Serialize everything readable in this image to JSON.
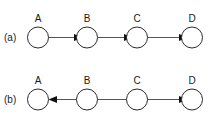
{
  "figure": {
    "background_color": "#ffffff",
    "stroke_color": "#555555",
    "node_stroke_color": "#2b2b2b",
    "node_fill_color": "#ffffff",
    "arrowhead_color": "#111111",
    "label_color": "#1a1a1a",
    "node_radius": 10.5
  },
  "rows": [
    {
      "id": "a",
      "label": "(a)",
      "label_x": 4,
      "label_y": 41,
      "center_y": 37.5,
      "nodes": [
        {
          "name": "A",
          "cx": 38,
          "cy": 37.5,
          "label_x": 38,
          "label_y": 22
        },
        {
          "name": "B",
          "cx": 87,
          "cy": 37.5,
          "label_x": 87,
          "label_y": 22
        },
        {
          "name": "C",
          "cx": 137,
          "cy": 37.5,
          "label_x": 137,
          "label_y": 22
        },
        {
          "name": "D",
          "cx": 192,
          "cy": 37.5,
          "label_x": 192,
          "label_y": 22
        }
      ],
      "edges": [
        {
          "from": "A",
          "to": "B",
          "direction": "right",
          "x1": 48.5,
          "x2": 76.5,
          "y": 37.5
        },
        {
          "from": "B",
          "to": "C",
          "direction": "right",
          "x1": 97.5,
          "x2": 126.5,
          "y": 37.5
        },
        {
          "from": "C",
          "to": "D",
          "direction": "right",
          "x1": 147.5,
          "x2": 181.5,
          "y": 37.5
        }
      ]
    },
    {
      "id": "b",
      "label": "(b)",
      "label_x": 4,
      "label_y": 103,
      "center_y": 99.5,
      "nodes": [
        {
          "name": "A",
          "cx": 38,
          "cy": 99.5,
          "label_x": 38,
          "label_y": 84
        },
        {
          "name": "B",
          "cx": 87,
          "cy": 99.5,
          "label_x": 87,
          "label_y": 84
        },
        {
          "name": "C",
          "cx": 137,
          "cy": 99.5,
          "label_x": 137,
          "label_y": 84
        },
        {
          "name": "D",
          "cx": 192,
          "cy": 99.5,
          "label_x": 192,
          "label_y": 84
        }
      ],
      "edges": [
        {
          "from": "B",
          "to": "A",
          "direction": "left",
          "x1": 87,
          "x2": 48.5,
          "y": 99.5
        },
        {
          "from": "C",
          "to": "D",
          "direction": "right",
          "x1": 137,
          "x2": 181.5,
          "y": 99.5
        }
      ]
    }
  ]
}
